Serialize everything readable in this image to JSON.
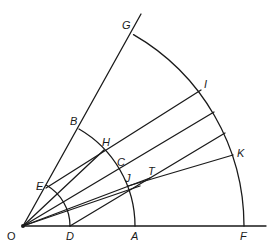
{
  "diagram": {
    "type": "geometric-construction",
    "stroke_color": "#1a1a1a",
    "origin": {
      "name": "O",
      "x": 23,
      "y": 226
    },
    "points": [
      {
        "name": "O",
        "x": 23,
        "y": 226,
        "lx": 8,
        "ly": 230
      },
      {
        "name": "D",
        "x": 70,
        "y": 226,
        "lx": 66,
        "ly": 232
      },
      {
        "name": "A",
        "x": 135,
        "y": 226,
        "lx": 131,
        "ly": 232
      },
      {
        "name": "F",
        "x": 244,
        "y": 226,
        "lx": 240,
        "ly": 232
      },
      {
        "name": "E",
        "x": 46,
        "y": 188,
        "lx": 36,
        "ly": 180
      },
      {
        "name": "B",
        "x": 78,
        "y": 127,
        "lx": 70,
        "ly": 115
      },
      {
        "name": "G",
        "x": 134,
        "y": 28,
        "lx": 122,
        "ly": 20
      },
      {
        "name": "H",
        "x": 104,
        "y": 150,
        "lx": 102,
        "ly": 137
      },
      {
        "name": "C",
        "x": 120,
        "y": 170,
        "lx": 117,
        "ly": 157
      },
      {
        "name": "J",
        "x": 128,
        "y": 186,
        "lx": 125,
        "ly": 174
      },
      {
        "name": "T",
        "x": 150,
        "y": 178,
        "lx": 148,
        "ly": 166
      },
      {
        "name": "I",
        "x": 201,
        "y": 90,
        "lx": 203,
        "ly": 79
      },
      {
        "name": "K",
        "x": 233,
        "y": 155,
        "lx": 237,
        "ly": 147
      }
    ],
    "labels": {
      "O": "O",
      "D": "D",
      "A": "A",
      "F": "F",
      "E": "E",
      "B": "B",
      "G": "G",
      "H": "H",
      "C": "C",
      "J": "J",
      "T": "T",
      "I": "I",
      "K": "K"
    },
    "arcs": [
      {
        "name": "arc-DE",
        "radius": 47
      },
      {
        "name": "arc-AB",
        "radius": 112
      },
      {
        "name": "arc-FG",
        "radius": 221
      }
    ]
  }
}
